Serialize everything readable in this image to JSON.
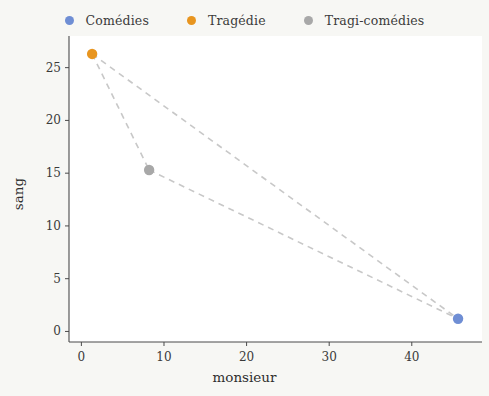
{
  "chart_data": {
    "type": "scatter",
    "title": "",
    "xlabel": "monsieur",
    "ylabel": "sang",
    "xlim": [
      -1.5,
      48.5
    ],
    "ylim": [
      -1.0,
      28.0
    ],
    "xticks": [
      0,
      10,
      20,
      30,
      40
    ],
    "yticks": [
      0,
      5,
      10,
      15,
      20,
      25
    ],
    "xtick_labels": [
      "0",
      "10",
      "20",
      "30",
      "40"
    ],
    "ytick_labels": [
      "0",
      "5",
      "10",
      "15",
      "20",
      "25"
    ],
    "grid": false,
    "legend_position": "top-center",
    "connector_style": "dashed",
    "connector_color": "#c8c8c8",
    "series": [
      {
        "name": "Comédies",
        "color": "#6f8ed4",
        "points": [
          {
            "x": 45.6,
            "y": 1.2
          }
        ]
      },
      {
        "name": "Tragédie",
        "color": "#e8951f",
        "points": [
          {
            "x": 1.3,
            "y": 26.3
          }
        ]
      },
      {
        "name": "Tragi-comédies",
        "color": "#a8a8a8",
        "points": [
          {
            "x": 8.2,
            "y": 15.3
          }
        ]
      }
    ],
    "connectors": [
      {
        "from": "Tragédie",
        "to": "Tragi-comédies"
      },
      {
        "from": "Tragédie",
        "to": "Comédies"
      },
      {
        "from": "Tragi-comédies",
        "to": "Comédies"
      }
    ]
  },
  "legend": {
    "entries": [
      {
        "label": "Comédies",
        "color": "#6f8ed4"
      },
      {
        "label": "Tragédie",
        "color": "#e8951f"
      },
      {
        "label": "Tragi-comédies",
        "color": "#a8a8a8"
      }
    ]
  },
  "axes": {
    "x_title": "monsieur",
    "y_title": "sang",
    "x_ticks": [
      "0",
      "10",
      "20",
      "30",
      "40"
    ],
    "y_ticks": [
      "0",
      "5",
      "10",
      "15",
      "20",
      "25"
    ]
  },
  "colors": {
    "figure_background": "#f7f7f4",
    "plot_background": "#ffffff",
    "axis_line": "#4a4a4a",
    "tick_text": "#3a3a3a",
    "connector": "#c8c8c8"
  }
}
